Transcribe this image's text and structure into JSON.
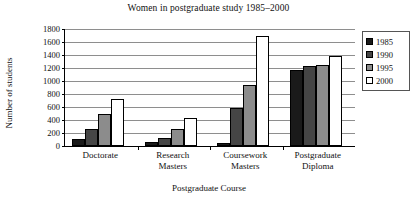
{
  "chart_data": {
    "type": "bar",
    "title": "Women in postgraduate study 1985–2000",
    "xlabel": "Postgraduate Course",
    "ylabel": "Number of students",
    "categories": [
      "Doctorate",
      "Research Masters",
      "Coursework Masters",
      "Postgraduate Diploma"
    ],
    "category_lines": [
      [
        "Doctorate"
      ],
      [
        "Research",
        "Masters"
      ],
      [
        "Coursework",
        "Masters"
      ],
      [
        "Postgraduate",
        "Diploma"
      ]
    ],
    "series": [
      {
        "name": "1985",
        "color": "#1a1a1a",
        "values": [
          110,
          60,
          45,
          1170
        ]
      },
      {
        "name": "1990",
        "color": "#454545",
        "values": [
          260,
          130,
          580,
          1230
        ]
      },
      {
        "name": "1995",
        "color": "#8c8c8c",
        "values": [
          500,
          265,
          940,
          1250
        ]
      },
      {
        "name": "2000",
        "color": "#ffffff",
        "values": [
          730,
          430,
          1700,
          1380
        ]
      }
    ],
    "ylim": [
      0,
      1800
    ],
    "ytick_step": 200,
    "yticks": [
      "0",
      "200",
      "400",
      "600",
      "800",
      "1000",
      "1200",
      "1400",
      "1600",
      "1800"
    ],
    "grid": true,
    "grid_axis": "y",
    "legend": {
      "position": "right",
      "entries": [
        "1985",
        "1990",
        "1995",
        "2000"
      ]
    }
  }
}
